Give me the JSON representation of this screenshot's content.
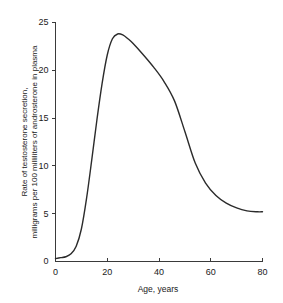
{
  "chart_data": {
    "type": "line",
    "title": "",
    "xlabel": "Age, years",
    "ylabel_line1": "Rate of testosterone secretion,",
    "ylabel_line2": "milligrams per 100 milliliters of androsterone in plasma",
    "ylabel": "Rate of testosterone secretion, milligrams per 100 milliliters of androsterone in plasma",
    "xlim": [
      0,
      80
    ],
    "ylim": [
      0,
      25
    ],
    "xticks": [
      0,
      20,
      40,
      60,
      80
    ],
    "yticks": [
      0,
      5,
      10,
      15,
      20,
      25
    ],
    "xtick_labels": [
      "0",
      "20",
      "40",
      "60",
      "80"
    ],
    "ytick_labels": [
      "0",
      "5",
      "10",
      "15",
      "20",
      "25"
    ],
    "grid": false,
    "legend": false,
    "legend_position": "none",
    "line_color": "#2b2b2b",
    "axis_color": "#3a3a3a",
    "background_color": "#ffffff",
    "series": [
      {
        "name": "Testosterone secretion rate",
        "x": [
          0,
          2,
          4,
          6,
          8,
          10,
          12,
          14,
          16,
          18,
          20,
          22,
          24,
          26,
          28,
          30,
          34,
          38,
          42,
          46,
          50,
          54,
          58,
          62,
          66,
          70,
          74,
          78,
          80
        ],
        "y": [
          0.3,
          0.4,
          0.5,
          0.8,
          1.6,
          3.4,
          6.6,
          10.6,
          14.8,
          18.6,
          21.6,
          23.3,
          23.8,
          23.7,
          23.3,
          22.8,
          21.6,
          20.3,
          18.8,
          16.8,
          13.6,
          10.3,
          8.2,
          6.9,
          6.1,
          5.6,
          5.3,
          5.2,
          5.2
        ]
      }
    ],
    "annotations": [],
    "peak": {
      "x": 24,
      "y": 23.8
    }
  }
}
